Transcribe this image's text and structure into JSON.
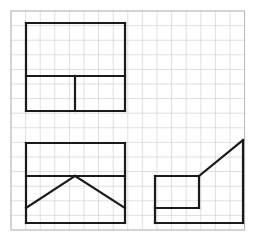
{
  "page": {
    "background_color": "#ffffff",
    "width": 271,
    "height": 251
  },
  "grid": {
    "name": "graph-paper-grid",
    "origin_x": 11,
    "origin_y": 11,
    "cell_size": 14.6,
    "cols": 16,
    "rows": 15,
    "line_color": "#c9c9c9",
    "line_width": 0.6,
    "border_color": "#b4b4b4",
    "border_width": 0.9
  },
  "drawing": {
    "stroke_color": "#1a1a1a",
    "stroke_width": 2.2,
    "figures": [
      {
        "name": "figure-top-left",
        "label": "Upper rectangle with interior cross partition",
        "outline": [
          [
            26,
            23
          ],
          [
            125,
            23
          ],
          [
            125,
            111
          ],
          [
            26,
            111
          ]
        ],
        "segments": [
          {
            "name": "outer-top-edge",
            "x1": 26,
            "y1": 23,
            "x2": 125,
            "y2": 23
          },
          {
            "name": "outer-right-edge",
            "x1": 125,
            "y1": 23,
            "x2": 125,
            "y2": 111
          },
          {
            "name": "outer-bottom-edge",
            "x1": 125,
            "y1": 111,
            "x2": 26,
            "y2": 111
          },
          {
            "name": "outer-left-edge",
            "x1": 26,
            "y1": 111,
            "x2": 26,
            "y2": 23
          },
          {
            "name": "interior-horizontal-divider",
            "x1": 26,
            "y1": 76,
            "x2": 125,
            "y2": 76
          },
          {
            "name": "interior-vertical-divider",
            "x1": 75,
            "y1": 76,
            "x2": 75,
            "y2": 111
          }
        ]
      },
      {
        "name": "figure-bottom-left",
        "label": "Lower rectangle with horizontal divider and chevron peak",
        "outline": [
          [
            26,
            143
          ],
          [
            125,
            143
          ],
          [
            125,
            223
          ],
          [
            26,
            223
          ]
        ],
        "segments": [
          {
            "name": "outer-top-edge",
            "x1": 26,
            "y1": 143,
            "x2": 125,
            "y2": 143
          },
          {
            "name": "outer-right-edge",
            "x1": 125,
            "y1": 143,
            "x2": 125,
            "y2": 223
          },
          {
            "name": "outer-bottom-edge",
            "x1": 125,
            "y1": 223,
            "x2": 26,
            "y2": 223
          },
          {
            "name": "outer-left-edge",
            "x1": 26,
            "y1": 223,
            "x2": 26,
            "y2": 143
          },
          {
            "name": "interior-horizontal-divider",
            "x1": 26,
            "y1": 176,
            "x2": 125,
            "y2": 176
          },
          {
            "name": "chevron-left-slope",
            "x1": 26,
            "y1": 208,
            "x2": 75,
            "y2": 176
          },
          {
            "name": "chevron-right-slope",
            "x1": 75,
            "y1": 176,
            "x2": 125,
            "y2": 208
          }
        ]
      },
      {
        "name": "figure-bottom-right",
        "label": "Right-angle step with rising diagonal ramp",
        "outline": [
          [
            155,
            223
          ],
          [
            155,
            176
          ],
          [
            199,
            176
          ],
          [
            243,
            140
          ],
          [
            243,
            223
          ]
        ],
        "segments": [
          {
            "name": "inner-rectangle-top-edge",
            "x1": 155,
            "y1": 176,
            "x2": 199,
            "y2": 176
          },
          {
            "name": "inner-rectangle-left-edge",
            "x1": 155,
            "y1": 176,
            "x2": 155,
            "y2": 208
          },
          {
            "name": "inner-rectangle-bottom-edge",
            "x1": 155,
            "y1": 208,
            "x2": 199,
            "y2": 208
          },
          {
            "name": "inner-rectangle-right-edge",
            "x1": 199,
            "y1": 176,
            "x2": 199,
            "y2": 208
          },
          {
            "name": "diagonal-ramp",
            "x1": 199,
            "y1": 176,
            "x2": 243,
            "y2": 140
          },
          {
            "name": "tall-right-edge",
            "x1": 243,
            "y1": 140,
            "x2": 243,
            "y2": 223
          },
          {
            "name": "base-bottom-edge",
            "x1": 243,
            "y1": 223,
            "x2": 155,
            "y2": 223
          },
          {
            "name": "base-left-edge",
            "x1": 155,
            "y1": 223,
            "x2": 155,
            "y2": 208
          }
        ]
      }
    ]
  },
  "caption": {
    "text": ""
  }
}
